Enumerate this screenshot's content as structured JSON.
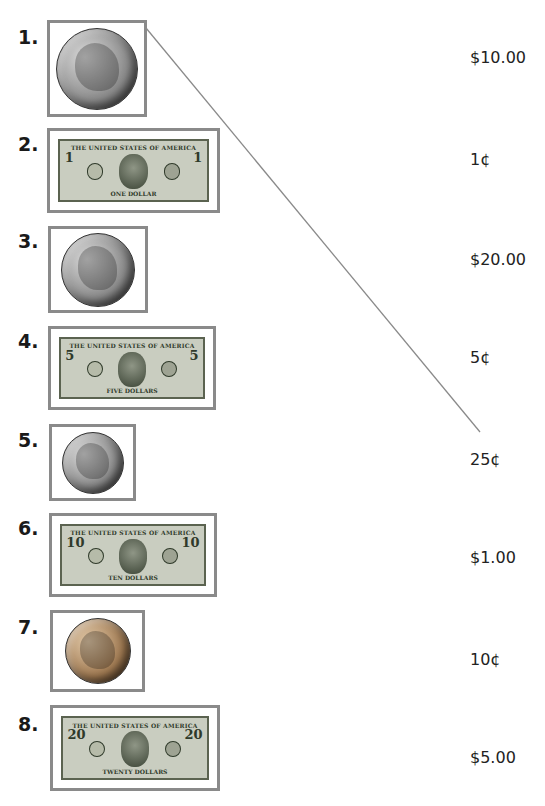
{
  "worksheet": {
    "items": [
      {
        "number": "1.",
        "kind": "coin",
        "name": "quarter",
        "metal": "silver"
      },
      {
        "number": "2.",
        "kind": "bill",
        "name": "one dollar bill",
        "corner": "1",
        "top_text": "THE UNITED STATES OF AMERICA",
        "bottom_text": "ONE DOLLAR"
      },
      {
        "number": "3.",
        "kind": "coin",
        "name": "nickel",
        "metal": "silver"
      },
      {
        "number": "4.",
        "kind": "bill",
        "name": "five dollar bill",
        "corner": "5",
        "top_text": "THE UNITED STATES OF AMERICA",
        "bottom_text": "FIVE DOLLARS"
      },
      {
        "number": "5.",
        "kind": "coin",
        "name": "dime",
        "metal": "silver"
      },
      {
        "number": "6.",
        "kind": "bill",
        "name": "ten dollar bill",
        "corner": "10",
        "top_text": "THE UNITED STATES OF AMERICA",
        "bottom_text": "TEN DOLLARS"
      },
      {
        "number": "7.",
        "kind": "coin",
        "name": "penny",
        "metal": "copper"
      },
      {
        "number": "8.",
        "kind": "bill",
        "name": "twenty dollar bill",
        "corner": "20",
        "top_text": "THE UNITED STATES OF AMERICA",
        "bottom_text": "TWENTY DOLLARS"
      }
    ],
    "values": [
      "$10.00",
      "1¢",
      "$20.00",
      "5¢",
      "25¢",
      "$1.00",
      "10¢",
      "$5.00"
    ],
    "match_line": {
      "from_item": "1.",
      "to_value": "25¢",
      "color": "#8a8a8a"
    }
  }
}
